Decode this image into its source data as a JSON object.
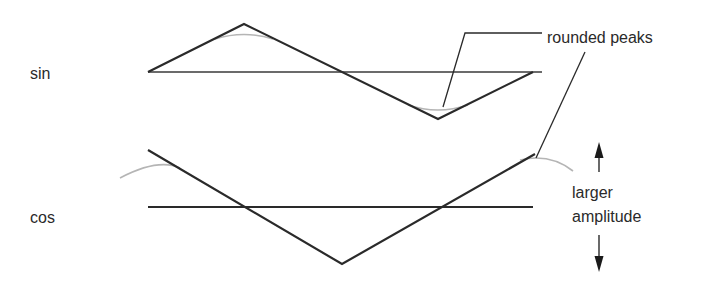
{
  "diagram": {
    "rows": [
      {
        "label": "sin",
        "axis": {
          "x1": 148,
          "y": 72,
          "x2": 542
        },
        "triangle_wave": [
          [
            148,
            72
          ],
          [
            244,
            24
          ],
          [
            438,
            119
          ],
          [
            533,
            72
          ]
        ],
        "rounded_curves": [
          "M 215 39 Q 244 30 273 39",
          "M 408 105 Q 438 115 468 105"
        ]
      },
      {
        "label": "cos",
        "axis": {
          "x1": 148,
          "y": 207,
          "x2": 533
        },
        "triangle_wave": [
          [
            148,
            150
          ],
          [
            342,
            264
          ],
          [
            535,
            154
          ]
        ],
        "rounded_curves": [
          "M 120 178 Q 158 158 180 168",
          "M 520 160 Q 550 153 573 171"
        ]
      }
    ],
    "annotations": {
      "rounded_peaks": {
        "text": "rounded peaks",
        "leader_1": [
          [
            443,
            107
          ],
          [
            465,
            33
          ],
          [
            542,
            33
          ]
        ],
        "leader_2": [
          [
            585,
            52
          ],
          [
            536,
            158
          ]
        ]
      },
      "larger_amplitude": {
        "line1": "larger",
        "line2": "amplitude",
        "arrow_up": {
          "x": 599,
          "tip_y": 142,
          "tail_y": 172
        },
        "arrow_down": {
          "x": 599,
          "tail_y": 235,
          "tip_y": 272
        }
      }
    },
    "colors": {
      "wave": "#2a2a2a",
      "axis": "#3a3a3a",
      "rounded_curve": "#b5b5b5",
      "text": "#2a2a2a"
    }
  }
}
